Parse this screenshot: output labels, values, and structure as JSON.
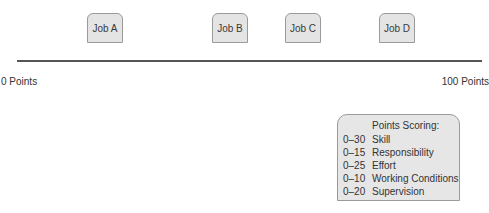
{
  "jobs": [
    {
      "label": "Job A",
      "left": 87
    },
    {
      "label": "Job B",
      "left": 212
    },
    {
      "label": "Job C",
      "left": 285
    },
    {
      "label": "Job D",
      "left": 379
    }
  ],
  "scale": {
    "min_label": "0 Points",
    "max_label": "100 Points"
  },
  "legend": {
    "title": "Points Scoring:",
    "rows": [
      {
        "range": "0–30",
        "factor": "Skill"
      },
      {
        "range": "0–15",
        "factor": "Responsibility"
      },
      {
        "range": "0–25",
        "factor": "Effort"
      },
      {
        "range": "0–10",
        "factor": "Working Conditions"
      },
      {
        "range": "0–20",
        "factor": "Supervision"
      }
    ]
  },
  "colors": {
    "box_fill": "#e4e4e4",
    "box_border": "#9a9a9a",
    "line": "#555555"
  }
}
